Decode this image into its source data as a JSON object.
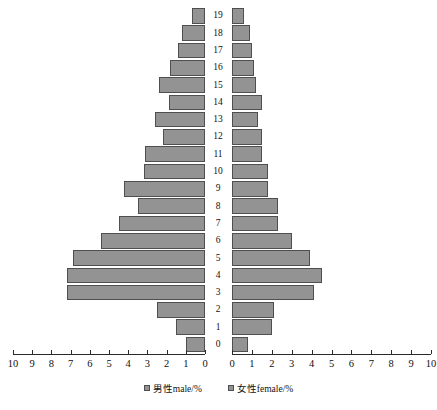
{
  "chart_data": {
    "type": "bar",
    "subtype": "population-pyramid",
    "title": "",
    "xlabel": "",
    "ylabel": "",
    "orientation": "horizontal",
    "grid": false,
    "legend_position": "bottom",
    "categories": [
      "0",
      "1",
      "2",
      "3",
      "4",
      "5",
      "6",
      "7",
      "8",
      "9",
      "10",
      "11",
      "12",
      "13",
      "14",
      "15",
      "16",
      "17",
      "18",
      "19"
    ],
    "left_axis": {
      "label": "男性male/%",
      "ticks": [
        "10",
        "9",
        "8",
        "7",
        "6",
        "5",
        "4",
        "3",
        "2",
        "1",
        "0"
      ],
      "tick_values": [
        10,
        9,
        8,
        7,
        6,
        5,
        4,
        3,
        2,
        1,
        0
      ],
      "range": [
        0,
        10
      ],
      "direction": "reversed"
    },
    "right_axis": {
      "label": "女性female/%",
      "ticks": [
        "0",
        "1",
        "2",
        "3",
        "4",
        "5",
        "6",
        "7",
        "8",
        "9",
        "10"
      ],
      "tick_values": [
        0,
        1,
        2,
        3,
        4,
        5,
        6,
        7,
        8,
        9,
        10
      ],
      "range": [
        0,
        10
      ],
      "direction": "normal"
    },
    "series": [
      {
        "name": "男性male/%",
        "side": "left",
        "values": [
          1.0,
          1.5,
          2.5,
          7.2,
          7.2,
          6.9,
          5.4,
          4.5,
          3.5,
          4.2,
          3.2,
          3.1,
          2.2,
          2.6,
          1.9,
          2.4,
          1.8,
          1.4,
          1.2,
          0.7
        ]
      },
      {
        "name": "女性female/%",
        "side": "right",
        "values": [
          0.8,
          2.0,
          2.1,
          4.1,
          4.5,
          3.9,
          3.0,
          2.3,
          2.3,
          1.8,
          1.8,
          1.5,
          1.5,
          1.3,
          1.5,
          1.2,
          1.1,
          1.0,
          0.9,
          0.6
        ]
      }
    ],
    "colors": {
      "bar_fill": "#939393",
      "bar_border": "#4f4f4f",
      "axis": "#2b2b2b",
      "text": "#111111",
      "background": "#ffffff"
    }
  },
  "legend": {
    "items": [
      {
        "label": "男性male/%"
      },
      {
        "label": "女性female/%"
      }
    ]
  }
}
